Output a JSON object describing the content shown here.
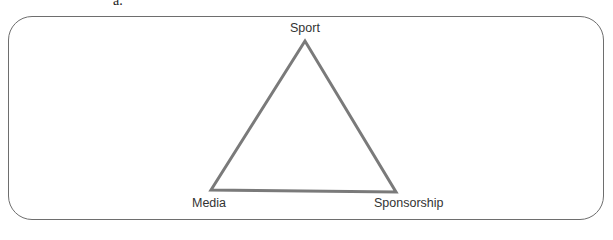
{
  "figure": {
    "panel_label": "a.",
    "frame": {
      "border_color": "#6e6e6e",
      "corner_radius": 24
    },
    "triangle": {
      "stroke_color": "#7a7a7a",
      "stroke_width": 3,
      "vertices": {
        "top": {
          "label": "Sport",
          "x": 305,
          "y": 41
        },
        "bottom_left": {
          "label": "Media",
          "x": 211,
          "y": 190
        },
        "bottom_right": {
          "label": "Sponsorship",
          "x": 396,
          "y": 192
        }
      }
    }
  }
}
